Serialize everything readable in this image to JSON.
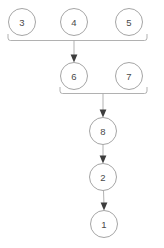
{
  "diagram": {
    "type": "directed-graph",
    "background_color": "#ffffff",
    "node_stroke_color": "#9b9b9b",
    "node_fill_color": "#ffffff",
    "label_color": "#4a4a4a",
    "edge_color": "#a8a8a8",
    "arrowhead_color": "#3d3d3d",
    "node_radius": 13.5,
    "nodes": [
      {
        "id": "3",
        "label": "3",
        "cx": 22,
        "cy": 22,
        "row": 0
      },
      {
        "id": "4",
        "label": "4",
        "cx": 74,
        "cy": 22,
        "row": 0
      },
      {
        "id": "5",
        "label": "5",
        "cx": 129,
        "cy": 22,
        "row": 0
      },
      {
        "id": "6",
        "label": "6",
        "cx": 74,
        "cy": 76,
        "row": 1
      },
      {
        "id": "7",
        "label": "7",
        "cx": 129,
        "cy": 76,
        "row": 1
      },
      {
        "id": "8",
        "label": "8",
        "cx": 103,
        "cy": 131,
        "row": 2
      },
      {
        "id": "2",
        "label": "2",
        "cx": 103,
        "cy": 177,
        "row": 3
      },
      {
        "id": "1",
        "label": "1",
        "cx": 104,
        "cy": 224,
        "row": 4
      }
    ],
    "groups": [
      {
        "id": "group-345",
        "members": [
          "3",
          "4",
          "5"
        ],
        "bracket_y": 40,
        "bracket_left": 8,
        "bracket_right": 147,
        "merge_x": 74,
        "target": "6"
      },
      {
        "id": "group-67",
        "members": [
          "6",
          "7"
        ],
        "bracket_y": 93,
        "bracket_left": 60,
        "bracket_right": 147,
        "merge_x": 103,
        "target": "8"
      }
    ],
    "edges": [
      {
        "id": "edge-345-6",
        "from": "3,4,5",
        "to": "6",
        "style": "bracket-merge"
      },
      {
        "id": "edge-67-8",
        "from": "6,7",
        "to": "8",
        "style": "bracket-merge"
      },
      {
        "id": "edge-8-2",
        "from": "8",
        "to": "2",
        "style": "straight"
      },
      {
        "id": "edge-2-1",
        "from": "2",
        "to": "1",
        "style": "straight"
      }
    ]
  }
}
